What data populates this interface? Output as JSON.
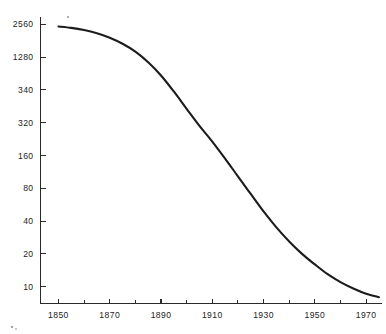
{
  "chart_data": {
    "type": "line",
    "title": "",
    "subtitle": "",
    "xlabel": "",
    "ylabel": "",
    "yscale": "log2",
    "xlim": [
      1843,
      1976
    ],
    "ylim": [
      7,
      2900
    ],
    "grid": false,
    "legend": null,
    "annotations": [],
    "y_ticks": [
      {
        "value": 10,
        "label": "10"
      },
      {
        "value": 20,
        "label": "20"
      },
      {
        "value": 40,
        "label": "40"
      },
      {
        "value": 80,
        "label": "80"
      },
      {
        "value": 160,
        "label": "160"
      },
      {
        "value": 320,
        "label": "320"
      },
      {
        "value": 640,
        "label": "340"
      },
      {
        "value": 1280,
        "label": "1280"
      },
      {
        "value": 2560,
        "label": "2560"
      }
    ],
    "x_ticks_major": [
      {
        "value": 1850,
        "label": "1850"
      },
      {
        "value": 1870,
        "label": "1870"
      },
      {
        "value": 1890,
        "label": "1890"
      },
      {
        "value": 1910,
        "label": "1910"
      },
      {
        "value": 1930,
        "label": "1930"
      },
      {
        "value": 1950,
        "label": "1950"
      },
      {
        "value": 1970,
        "label": "1970"
      }
    ],
    "x_ticks_minor": [
      1860,
      1880,
      1900,
      1920,
      1940,
      1960
    ],
    "series": [
      {
        "name": "",
        "x": [
          1850,
          1855,
          1860,
          1865,
          1870,
          1875,
          1880,
          1885,
          1890,
          1895,
          1900,
          1905,
          1910,
          1915,
          1920,
          1925,
          1930,
          1935,
          1940,
          1945,
          1950,
          1955,
          1960,
          1965,
          1970,
          1975
        ],
        "values": [
          2450,
          2380,
          2270,
          2120,
          1930,
          1700,
          1440,
          1150,
          870,
          620,
          430,
          300,
          215,
          150,
          103,
          71,
          49,
          35,
          26,
          20,
          16,
          13,
          11,
          9.6,
          8.6,
          8.0
        ]
      }
    ]
  },
  "specks": [
    {
      "x": 68,
      "y": 17,
      "r": 0.9
    },
    {
      "x": 12,
      "y": 327,
      "r": 1.1
    },
    {
      "x": 16,
      "y": 329,
      "r": 0.8
    }
  ]
}
